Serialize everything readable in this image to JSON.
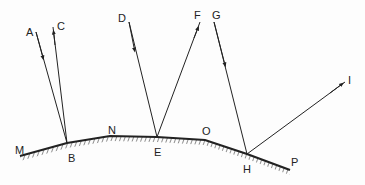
{
  "diagram": {
    "surface_points": [
      "M",
      "B",
      "N",
      "E",
      "O",
      "H",
      "P"
    ],
    "labels": {
      "A": "A",
      "C": "C",
      "D": "D",
      "F": "F",
      "G": "G",
      "I": "I",
      "M": "M",
      "B": "B",
      "N": "N",
      "E": "E",
      "O": "O",
      "H": "H",
      "P": "P"
    },
    "rays": [
      {
        "from": "A",
        "to": "B",
        "type": "incident"
      },
      {
        "from": "B",
        "to": "C",
        "type": "reflected"
      },
      {
        "from": "D",
        "to": "E",
        "type": "incident"
      },
      {
        "from": "E",
        "to": "F",
        "type": "reflected"
      },
      {
        "from": "G",
        "to": "H",
        "type": "incident"
      },
      {
        "from": "H",
        "to": "I",
        "type": "reflected"
      }
    ],
    "colors": {
      "line": "#222222",
      "background": "#fdfdfd"
    }
  }
}
